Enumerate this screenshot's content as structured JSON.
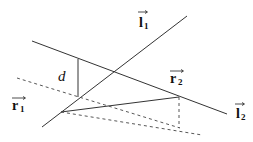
{
  "diagram": {
    "colors": {
      "line": "#333333",
      "background": "#ffffff"
    },
    "labels": {
      "l1": {
        "base": "l",
        "sub": "1"
      },
      "l2": {
        "base": "l",
        "sub": "2"
      },
      "r1": {
        "base": "r",
        "sub": "1"
      },
      "r2": {
        "base": "r",
        "sub": "2"
      },
      "d": "d"
    },
    "lines": [
      {
        "id": "line-l1",
        "style": "solid",
        "from": [
          42,
          127
        ],
        "to": [
          187,
          16
        ]
      },
      {
        "id": "line-l2",
        "style": "solid",
        "from": [
          32,
          41
        ],
        "to": [
          227,
          114
        ]
      },
      {
        "id": "distance-d",
        "style": "solid",
        "from": [
          78,
          59
        ],
        "to": [
          78,
          97
        ]
      },
      {
        "id": "connector",
        "style": "solid",
        "from": [
          61,
          112
        ],
        "to": [
          179,
          97
        ]
      },
      {
        "id": "projection-upper",
        "style": "dashed",
        "from": [
          17,
          78
        ],
        "to": [
          180,
          128
        ]
      },
      {
        "id": "projection-lower",
        "style": "dashed",
        "from": [
          61,
          112
        ],
        "to": [
          202,
          135
        ]
      },
      {
        "id": "projection-vertical",
        "style": "dashed",
        "from": [
          179,
          97
        ],
        "to": [
          179,
          128
        ]
      }
    ]
  }
}
